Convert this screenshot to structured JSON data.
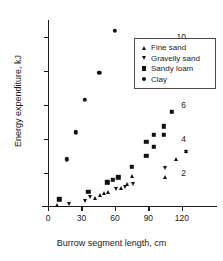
{
  "chart_data": {
    "type": "scatter",
    "title": "",
    "xlabel": "Burrow segment length, cm",
    "ylabel": "Energy expenditure, kJ",
    "xlim": [
      0,
      130
    ],
    "ylim": [
      0,
      11
    ],
    "xticks": [
      0,
      30,
      60,
      90,
      120
    ],
    "yticks": [
      2,
      4,
      6,
      8,
      10
    ],
    "xtick_labels": [
      "0",
      "30",
      "60",
      "90",
      "120"
    ],
    "ytick_labels": [
      "2",
      "4",
      "6",
      "8",
      "10"
    ],
    "grid": false,
    "legend_position": "upper right",
    "marker_color": "#111111",
    "series": [
      {
        "name": "Fine sand",
        "marker": "triangle-up",
        "points": [
          [
            8,
            0.1
          ],
          [
            42,
            0.55
          ],
          [
            47,
            0.7
          ],
          [
            50,
            0.8
          ],
          [
            54,
            0.88
          ],
          [
            65,
            1.1
          ],
          [
            71,
            1.35
          ],
          [
            75,
            1.8
          ],
          [
            105,
            1.75
          ],
          [
            115,
            2.85
          ],
          [
            124,
            3.3
          ]
        ]
      },
      {
        "name": "Gravelly sand",
        "marker": "triangle-down",
        "points": [
          [
            19,
            0.18
          ],
          [
            33,
            0.35
          ],
          [
            38,
            0.6
          ],
          [
            61,
            1.05
          ],
          [
            69,
            1.2
          ],
          [
            76,
            1.35
          ],
          [
            105,
            2.3
          ],
          [
            124,
            3.25
          ]
        ]
      },
      {
        "name": "Sandy loam",
        "marker": "square",
        "points": [
          [
            10,
            0.45
          ],
          [
            36,
            0.9
          ],
          [
            53,
            1.45
          ],
          [
            58,
            1.6
          ],
          [
            63,
            1.75
          ],
          [
            75,
            2.35
          ],
          [
            88,
            3.0
          ],
          [
            88,
            3.85
          ],
          [
            95,
            3.55
          ],
          [
            95,
            4.25
          ],
          [
            104,
            4.25
          ],
          [
            104,
            4.75
          ],
          [
            111,
            5.6
          ]
        ]
      },
      {
        "name": "Clay",
        "marker": "circle",
        "points": [
          [
            17,
            2.8
          ],
          [
            25,
            4.4
          ],
          [
            33,
            6.3
          ],
          [
            46,
            7.9
          ],
          [
            60,
            10.35
          ]
        ]
      }
    ]
  },
  "legend": {
    "items": [
      {
        "label": "Fine sand",
        "marker": "triangle-up"
      },
      {
        "label": "Gravelly sand",
        "marker": "triangle-down"
      },
      {
        "label": "Sandy loam",
        "marker": "square"
      },
      {
        "label": "Clay",
        "marker": "circle"
      }
    ]
  }
}
